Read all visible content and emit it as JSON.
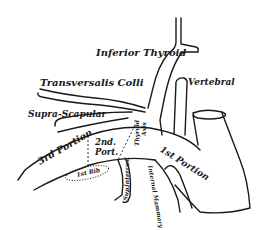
{
  "diagram": {
    "type": "anatomical line drawing",
    "labels": {
      "inferior_thyroid": "Inferior Thyroid",
      "transversalis_colli": "Transversalis Colli",
      "vertebral": "Vertebral",
      "supra_scapular": "Supra-Scapular",
      "third_portion": "3rd Portion",
      "second_portion_line1": "2nd.",
      "second_portion_line2": "Port.",
      "first_portion": "1st Portion",
      "thyroid_axis_line1": "Thyroid",
      "thyroid_axis_line2": "Axis",
      "first_rib": "1st Rib",
      "sup_intercostal_line1": "Sup.",
      "sup_intercostal_line2": "Intercos.",
      "internal_mammary": "Internal Mammary"
    },
    "colors": {
      "ink": "#1a1a1a",
      "background": "#ffffff"
    }
  }
}
